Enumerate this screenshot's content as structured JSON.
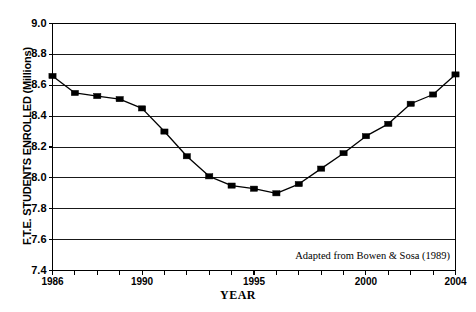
{
  "chart_data": {
    "type": "line",
    "title": "",
    "xlabel": "YEAR",
    "ylabel": "F.T.E. STUDENTS ENROLLED (Millions)",
    "xlim": [
      1986,
      2004
    ],
    "ylim": [
      7.4,
      9.0
    ],
    "grid": true,
    "legend": false,
    "marker": "square",
    "line_color": "#000000",
    "marker_color": "#000000",
    "background_color": "#ffffff",
    "y_ticks": [
      "9.0",
      "8.8",
      "8.6",
      "8.4",
      "8.2",
      "8.0",
      "7.8",
      "7.6",
      "7.4"
    ],
    "y_tick_values": [
      9.0,
      8.8,
      8.6,
      8.4,
      8.2,
      8.0,
      7.8,
      7.6,
      7.4
    ],
    "x_ticks": [
      "1986",
      "1990",
      "1995",
      "2000",
      "2004"
    ],
    "x_tick_values": [
      1986,
      1990,
      1995,
      2000,
      2004
    ],
    "x": [
      1986,
      1987,
      1988,
      1989,
      1990,
      1991,
      1992,
      1993,
      1994,
      1995,
      1996,
      1997,
      1998,
      1999,
      2000,
      2001,
      2002,
      2003,
      2004
    ],
    "values": [
      8.66,
      8.55,
      8.53,
      8.51,
      8.45,
      8.3,
      8.14,
      8.01,
      7.95,
      7.93,
      7.9,
      7.96,
      8.06,
      8.16,
      8.27,
      8.35,
      8.48,
      8.54,
      8.67
    ],
    "categories": [
      "1986",
      "1987",
      "1988",
      "1989",
      "1990",
      "1991",
      "1992",
      "1993",
      "1994",
      "1995",
      "1996",
      "1997",
      "1998",
      "1999",
      "2000",
      "2001",
      "2002",
      "2003",
      "2004"
    ],
    "annotations": [
      {
        "text": "Adapted from Bowen & Sosa (1989)",
        "x": 2000.3,
        "y": 7.49
      }
    ]
  },
  "axes": {
    "xlabel": "YEAR",
    "ylabel": "F.T.E. STUDENTS ENROLLED (Millions)"
  },
  "source_note": "Adapted from Bowen & Sosa (1989)"
}
